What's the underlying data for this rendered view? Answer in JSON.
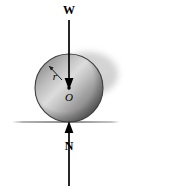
{
  "figure": {
    "title": "",
    "background_color": "#ffffff",
    "width": 172,
    "height": 194
  },
  "labels": {
    "weight": "W",
    "normal": "N",
    "radius": "r",
    "center": "O"
  },
  "colors": {
    "arrow": "#000000",
    "ground_line": "#8c8c8c",
    "sphere_outline": "#3a3a3a",
    "sphere_light": "#d9d9d9",
    "sphere_mid": "#a8a8a8",
    "sphere_dark": "#6e6e6e",
    "shadow": "#c8c8c8"
  },
  "geometry": {
    "sphere_center_x": 69,
    "sphere_center_y": 88,
    "sphere_radius": 34,
    "ground_y": 122,
    "ground_x_start": 12,
    "ground_x_end": 120,
    "weight_arrow_top_y": 20,
    "weight_arrow_tip_y": 88,
    "normal_arrow_bottom_y": 186,
    "normal_arrow_tip_y": 122
  }
}
